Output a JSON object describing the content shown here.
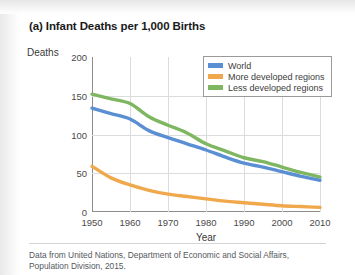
{
  "figure": {
    "title": "(a) Infant Deaths per 1,000 Births",
    "caption": "Data from United Nations, Department of Economic and Social Affairs, Population Division, 2015."
  },
  "colors": {
    "world": "#5b8fd4",
    "more_developed": "#f0a84c",
    "less_developed": "#7fb661",
    "gridline": "#dcdcdc",
    "axis": "#8c8c8c"
  },
  "chart_data": {
    "type": "line",
    "title": "(a) Infant Deaths per 1,000 Births",
    "xlabel": "Year",
    "ylabel": "Deaths",
    "xlim": [
      1950,
      2010
    ],
    "ylim": [
      0,
      200
    ],
    "xticks": [
      "1950",
      "1960",
      "1970",
      "1980",
      "1990",
      "2000",
      "2010"
    ],
    "yticks": [
      "0",
      "50",
      "100",
      "150",
      "200"
    ],
    "grid": true,
    "legend_position": "top-right",
    "x": [
      1950,
      1955,
      1960,
      1965,
      1970,
      1975,
      1980,
      1985,
      1990,
      1995,
      2000,
      2005,
      2010
    ],
    "series": [
      {
        "name": "World",
        "color": "#5b8fd4",
        "values": [
          134,
          127,
          120,
          105,
          96,
          88,
          80,
          71,
          63,
          58,
          52,
          46,
          41
        ]
      },
      {
        "name": "More developed regions",
        "color": "#f0a84c",
        "values": [
          59,
          44,
          35,
          28,
          23,
          20,
          17,
          14,
          12,
          10,
          8,
          7,
          6
        ]
      },
      {
        "name": "Less developed regions",
        "color": "#7fb661",
        "values": [
          152,
          146,
          140,
          123,
          112,
          102,
          88,
          79,
          70,
          65,
          58,
          51,
          45
        ]
      }
    ]
  },
  "legend": {
    "items": [
      {
        "label": "World",
        "color": "#5b8fd4"
      },
      {
        "label": "More developed regions",
        "color": "#f0a84c"
      },
      {
        "label": "Less developed regions",
        "color": "#7fb661"
      }
    ]
  }
}
